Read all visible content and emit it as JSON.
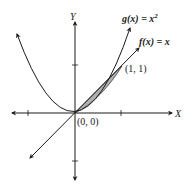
{
  "diagram": {
    "axes": {
      "x_label": "X",
      "y_label": "Y"
    },
    "curves": [
      {
        "name": "g",
        "label_fn": "g(x) = x",
        "exponent": "2",
        "expression": "x^2"
      },
      {
        "name": "f",
        "label_fn": "f(x) = x",
        "expression": "x"
      }
    ],
    "points": [
      {
        "label": "(0, 0)",
        "x": 0,
        "y": 0
      },
      {
        "label": "(1, 1)",
        "x": 1,
        "y": 1
      }
    ],
    "shaded_region": {
      "between": [
        "f(x) = x",
        "g(x) = x^2"
      ],
      "from": 0,
      "to": 1,
      "color": "#b0b0b0"
    },
    "ticks": {
      "x": [
        -1,
        1
      ],
      "y": [
        -1,
        1
      ]
    }
  }
}
